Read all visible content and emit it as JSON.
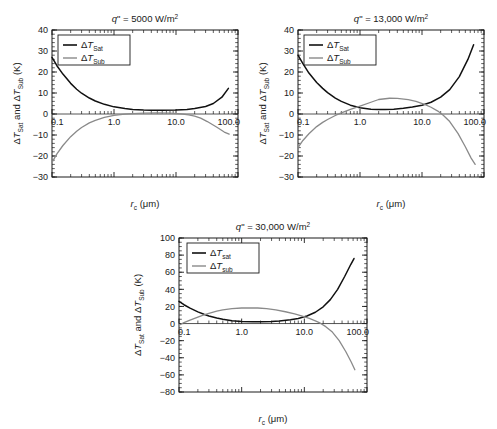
{
  "figure": {
    "panel_count": 3
  },
  "chart_data": [
    {
      "id": "panel-a",
      "type": "line",
      "title": "q\" = 5000 W/m2",
      "title_parts": {
        "symbol": "q",
        "prime": "\"",
        "equals": "=",
        "value": "5000 W/m",
        "exponent": "2"
      },
      "xlabel": "rc (μm)",
      "xlabel_parts": {
        "symbol": "r",
        "subscript": "c",
        "units": "(μm)"
      },
      "ylabel": "ΔTSat and ΔTSub (K)",
      "ylabel_parts": {
        "d1": "Δ",
        "t1": "T",
        "s1": "Sat",
        "conj": " and ",
        "d2": "Δ",
        "t2": "T",
        "s2": "Sub",
        "units": " (K)"
      },
      "xscale": "log",
      "xlim": [
        0.1,
        100.0
      ],
      "xticks": [
        0.1,
        1.0,
        10.0,
        100.0
      ],
      "xticklabels": [
        "0.1",
        "1.0",
        "10.0",
        "100.0"
      ],
      "ylim": [
        -30,
        40
      ],
      "yticks": [
        -30,
        -20,
        -10,
        0,
        10,
        20,
        30,
        40
      ],
      "yticklabels": [
        "−30",
        "−20",
        "−10",
        "0",
        "10",
        "20",
        "30",
        "40"
      ],
      "yminor_step": 2,
      "grid": false,
      "legend_position": "upper-left",
      "series": [
        {
          "name": "ΔTSat",
          "name_parts": {
            "delta": "Δ",
            "t": "T",
            "sub": "Sat"
          },
          "color": "#111111",
          "x": [
            0.1,
            0.12,
            0.15,
            0.2,
            0.25,
            0.3,
            0.4,
            0.5,
            0.7,
            1.0,
            1.5,
            2.0,
            3.0,
            4.0,
            6.0,
            10.0,
            15.0,
            20.0,
            30.0,
            40.0,
            55.0,
            70.0
          ],
          "y": [
            27.0,
            23.0,
            19.0,
            14.6,
            11.8,
            9.9,
            7.6,
            6.2,
            4.6,
            3.4,
            2.6,
            2.2,
            1.9,
            1.8,
            1.8,
            1.9,
            2.2,
            2.6,
            3.6,
            5.0,
            8.0,
            12.2
          ]
        },
        {
          "name": "ΔTSub",
          "name_parts": {
            "delta": "Δ",
            "t": "T",
            "sub": "Sub"
          },
          "color": "#8a8a8a",
          "x": [
            0.1,
            0.12,
            0.15,
            0.2,
            0.25,
            0.3,
            0.4,
            0.5,
            0.7,
            1.0,
            1.5,
            2.0,
            3.0,
            5.0,
            8.0,
            12.0,
            16.0,
            20.0,
            25.0,
            32.0,
            45.0,
            60.0,
            72.0
          ],
          "y": [
            -23.0,
            -19.0,
            -15.0,
            -10.8,
            -8.2,
            -6.4,
            -4.2,
            -3.0,
            -1.6,
            -0.7,
            -0.1,
            0.2,
            0.4,
            0.5,
            0.4,
            0.1,
            -0.4,
            -1.0,
            -2.0,
            -3.6,
            -6.2,
            -8.6,
            -9.6
          ]
        }
      ]
    },
    {
      "id": "panel-b",
      "type": "line",
      "title": "q\" = 13,000 W/m2",
      "title_parts": {
        "symbol": "q",
        "prime": "\"",
        "equals": "=",
        "value": "13,000 W/m",
        "exponent": "2"
      },
      "xlabel": "rc (μm)",
      "xlabel_parts": {
        "symbol": "r",
        "subscript": "c",
        "units": "(μm)"
      },
      "ylabel": "ΔTSat and ΔTSub (K)",
      "ylabel_parts": {
        "d1": "Δ",
        "t1": "T",
        "s1": "Sat",
        "conj": " and ",
        "d2": "Δ",
        "t2": "T",
        "s2": "Sub",
        "units": " (K)"
      },
      "xscale": "log",
      "xlim": [
        0.1,
        100.0
      ],
      "xticks": [
        0.1,
        1.0,
        10.0,
        100.0
      ],
      "xticklabels": [
        "0.1",
        "1.0",
        "10.0",
        "100.0"
      ],
      "ylim": [
        -30,
        40
      ],
      "yticks": [
        -30,
        -20,
        -10,
        0,
        10,
        20,
        30,
        40
      ],
      "yticklabels": [
        "−30",
        "−20",
        "−10",
        "0",
        "10",
        "20",
        "30",
        "40"
      ],
      "yminor_step": 2,
      "grid": false,
      "legend_position": "upper-left",
      "series": [
        {
          "name": "ΔTSat",
          "name_parts": {
            "delta": "Δ",
            "t": "T",
            "sub": "Sat"
          },
          "color": "#111111",
          "x": [
            0.1,
            0.12,
            0.15,
            0.2,
            0.25,
            0.3,
            0.4,
            0.5,
            0.7,
            1.0,
            1.5,
            2.0,
            2.5,
            3.5,
            5.0,
            7.0,
            10.0,
            14.0,
            20.0,
            28.0,
            40.0,
            55.0,
            68.0
          ],
          "y": [
            28.0,
            24.0,
            19.5,
            15.0,
            12.2,
            10.2,
            7.6,
            6.0,
            4.2,
            3.0,
            2.3,
            2.1,
            2.1,
            2.3,
            2.7,
            3.3,
            4.2,
            5.6,
            8.0,
            11.6,
            17.8,
            26.0,
            33.0
          ]
        },
        {
          "name": "ΔTSub",
          "name_parts": {
            "delta": "Δ",
            "t": "T",
            "sub": "Sub"
          },
          "color": "#8a8a8a",
          "x": [
            0.1,
            0.12,
            0.15,
            0.2,
            0.25,
            0.3,
            0.4,
            0.5,
            0.7,
            1.0,
            1.5,
            2.0,
            3.0,
            4.0,
            6.0,
            8.0,
            11.0,
            14.0,
            18.0,
            22.0,
            28.0,
            38.0,
            50.0,
            62.0,
            72.0
          ],
          "y": [
            -16.0,
            -12.6,
            -9.4,
            -6.0,
            -4.0,
            -2.6,
            -0.7,
            0.5,
            2.2,
            3.8,
            5.6,
            6.9,
            7.5,
            7.4,
            6.8,
            6.0,
            4.6,
            3.2,
            1.4,
            -0.6,
            -3.6,
            -9.2,
            -15.6,
            -21.0,
            -24.0
          ]
        }
      ]
    },
    {
      "id": "panel-c",
      "type": "line",
      "title": "q\" = 30,000 W/m2",
      "title_parts": {
        "symbol": "q",
        "prime": "\"",
        "equals": "=",
        "value": "30,000 W/m",
        "exponent": "2"
      },
      "xlabel": "rc (μm)",
      "xlabel_parts": {
        "symbol": "r",
        "subscript": "c",
        "units": "(μm)"
      },
      "ylabel": "ΔTSat and ΔTSub (K)",
      "ylabel_parts": {
        "d1": "Δ",
        "t1": "T",
        "s1": "Sat",
        "conj": " and ",
        "d2": "Δ",
        "t2": "T",
        "s2": "Sub",
        "units": " (K)"
      },
      "xscale": "log",
      "xlim": [
        0.1,
        100.0
      ],
      "xticks": [
        0.1,
        1.0,
        10.0,
        100.0
      ],
      "xticklabels": [
        "0.1",
        "1.0",
        "10.0",
        "100.0"
      ],
      "ylim": [
        -80,
        100
      ],
      "yticks": [
        -80,
        -60,
        -40,
        -20,
        0,
        20,
        40,
        60,
        80,
        100
      ],
      "yticklabels": [
        "−80",
        "−60",
        "−40",
        "−20",
        "0",
        "20",
        "40",
        "60",
        "80",
        "100"
      ],
      "yminor_step": 5,
      "grid": false,
      "legend_position": "upper-left",
      "series": [
        {
          "name": "ΔTsat",
          "name_parts": {
            "delta": "Δ",
            "t": "T",
            "sub": "sat"
          },
          "color": "#111111",
          "x": [
            0.1,
            0.12,
            0.15,
            0.2,
            0.25,
            0.3,
            0.4,
            0.5,
            0.7,
            1.0,
            1.5,
            2.0,
            3.0,
            4.0,
            6.0,
            8.0,
            11.0,
            15.0,
            20.0,
            26.0,
            34.0,
            44.0,
            55.0,
            62.0
          ],
          "y": [
            26.0,
            22.0,
            18.0,
            13.6,
            10.8,
            8.8,
            6.4,
            5.0,
            3.4,
            2.4,
            2.0,
            2.0,
            2.4,
            3.0,
            4.4,
            6.0,
            8.8,
            13.2,
            19.6,
            28.0,
            40.0,
            55.0,
            69.0,
            76.0
          ]
        },
        {
          "name": "ΔTsub",
          "name_parts": {
            "delta": "Δ",
            "t": "T",
            "sub": "sub"
          },
          "color": "#8a8a8a",
          "x": [
            0.1,
            0.12,
            0.15,
            0.2,
            0.25,
            0.3,
            0.4,
            0.5,
            0.7,
            1.0,
            1.4,
            1.8,
            2.5,
            3.5,
            5.0,
            7.0,
            9.0,
            12.0,
            15.0,
            18.0,
            22.0,
            28.0,
            36.0,
            46.0,
            56.0,
            64.0
          ],
          "y": [
            -2.0,
            1.0,
            4.0,
            7.6,
            10.2,
            12.0,
            14.4,
            16.0,
            17.4,
            18.2,
            18.4,
            18.2,
            17.4,
            16.0,
            13.8,
            11.2,
            9.0,
            6.0,
            3.2,
            0.4,
            -3.6,
            -10.0,
            -20.0,
            -33.0,
            -45.0,
            -54.0
          ]
        }
      ]
    }
  ]
}
